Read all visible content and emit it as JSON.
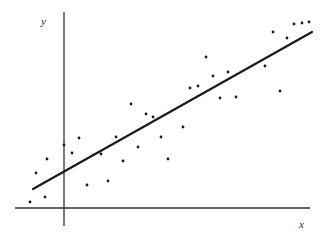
{
  "chart_data": {
    "type": "scatter",
    "title": "",
    "xlabel": "x",
    "ylabel": "y",
    "grid": false,
    "legend": null,
    "ticks": {
      "x": [],
      "y": []
    },
    "note": "Scatter plot with fitted linear regression line; coordinates are in pixel units relative to the figure (origin = axis intersection, y up).",
    "origin_px": [
      64,
      208
    ],
    "axes_px": {
      "x_axis": {
        "x1": 15,
        "x2": 310,
        "y": 208
      },
      "y_axis": {
        "x": 64,
        "y1": 12,
        "y2": 226
      }
    },
    "points": [
      {
        "x": -34,
        "y": 6
      },
      {
        "x": -19,
        "y": 11
      },
      {
        "x": -28,
        "y": 35
      },
      {
        "x": -17,
        "y": 49
      },
      {
        "x": 0,
        "y": 63
      },
      {
        "x": 8,
        "y": 55
      },
      {
        "x": 15,
        "y": 70
      },
      {
        "x": 23,
        "y": 23
      },
      {
        "x": 37,
        "y": 54
      },
      {
        "x": 44,
        "y": 27
      },
      {
        "x": 52,
        "y": 71
      },
      {
        "x": 59,
        "y": 47
      },
      {
        "x": 67,
        "y": 104
      },
      {
        "x": 74,
        "y": 61
      },
      {
        "x": 82,
        "y": 94
      },
      {
        "x": 89,
        "y": 91
      },
      {
        "x": 97,
        "y": 71
      },
      {
        "x": 104,
        "y": 49
      },
      {
        "x": 119,
        "y": 81
      },
      {
        "x": 126,
        "y": 120
      },
      {
        "x": 134,
        "y": 122
      },
      {
        "x": 142,
        "y": 151
      },
      {
        "x": 149,
        "y": 132
      },
      {
        "x": 156,
        "y": 110
      },
      {
        "x": 164,
        "y": 136
      },
      {
        "x": 172,
        "y": 111
      },
      {
        "x": 201,
        "y": 142
      },
      {
        "x": 209,
        "y": 176
      },
      {
        "x": 216,
        "y": 117
      },
      {
        "x": 223,
        "y": 170
      },
      {
        "x": 230,
        "y": 184
      },
      {
        "x": 238,
        "y": 185
      },
      {
        "x": 245,
        "y": 186
      }
    ],
    "regression_line": {
      "x1": -31,
      "y1": 19,
      "x2": 248,
      "y2": 176
    },
    "xlim": [
      -49,
      246
    ],
    "ylim": [
      -18,
      196
    ]
  }
}
